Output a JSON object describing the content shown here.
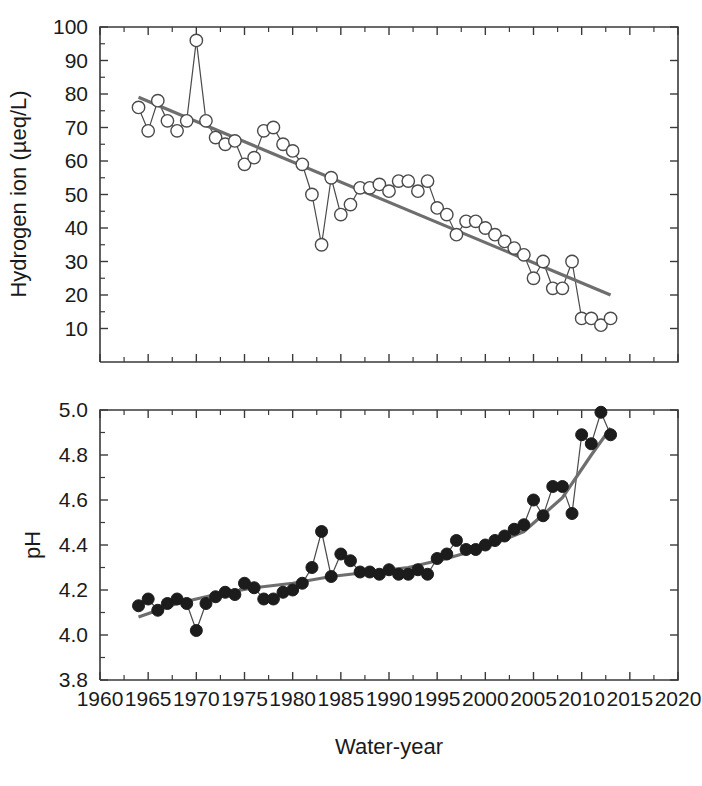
{
  "figure": {
    "width": 702,
    "height": 786,
    "background": "#ffffff",
    "xlabel": "Water-year"
  },
  "chart_data": [
    {
      "type": "line",
      "panel": "top",
      "title": "",
      "xlabel": "",
      "ylabel": "Hydrogen ion (µeq/L)",
      "xlim": [
        1960,
        2020
      ],
      "ylim": [
        0,
        100
      ],
      "xticks": [
        1960,
        1965,
        1970,
        1975,
        1980,
        1985,
        1990,
        1995,
        2000,
        2005,
        2010,
        2015,
        2020
      ],
      "xticklabels": [
        "",
        "",
        "",
        "",
        "",
        "",
        "",
        "",
        "",
        "",
        "",
        "",
        ""
      ],
      "yticks": [
        10,
        20,
        30,
        40,
        50,
        60,
        70,
        80,
        90,
        100
      ],
      "yticklabels": [
        "10",
        "20",
        "30",
        "40",
        "50",
        "60",
        "70",
        "80",
        "90",
        "100"
      ],
      "grid": false,
      "legend": "none",
      "marker": "open-circle",
      "series": [
        {
          "name": "Hydrogen ion",
          "x": [
            1964,
            1965,
            1966,
            1967,
            1968,
            1969,
            1970,
            1971,
            1972,
            1973,
            1974,
            1975,
            1976,
            1977,
            1978,
            1979,
            1980,
            1981,
            1982,
            1983,
            1984,
            1985,
            1986,
            1987,
            1988,
            1989,
            1990,
            1991,
            1992,
            1993,
            1994,
            1995,
            1996,
            1997,
            1998,
            1999,
            2000,
            2001,
            2002,
            2003,
            2004,
            2005,
            2006,
            2007,
            2008,
            2009,
            2010,
            2011,
            2012,
            2013
          ],
          "values": [
            76,
            69,
            78,
            72,
            69,
            72,
            96,
            72,
            67,
            65,
            66,
            59,
            61,
            69,
            70,
            65,
            63,
            59,
            50,
            35,
            55,
            44,
            47,
            52,
            52,
            53,
            51,
            54,
            54,
            51,
            54,
            46,
            44,
            38,
            42,
            42,
            40,
            38,
            36,
            34,
            32,
            25,
            30,
            22,
            22,
            30,
            13,
            13,
            11,
            13
          ]
        }
      ],
      "trend": {
        "name": "linear trend",
        "x": [
          1964,
          2013
        ],
        "values": [
          79,
          20
        ]
      }
    },
    {
      "type": "line",
      "panel": "bottom",
      "title": "",
      "xlabel": "Water-year",
      "ylabel": "pH",
      "xlim": [
        1960,
        2020
      ],
      "ylim": [
        3.8,
        5.0
      ],
      "xticks": [
        1960,
        1965,
        1970,
        1975,
        1980,
        1985,
        1990,
        1995,
        2000,
        2005,
        2010,
        2015,
        2020
      ],
      "xticklabels": [
        "1960",
        "1965",
        "1970",
        "1975",
        "1980",
        "1985",
        "1990",
        "1995",
        "2000",
        "2005",
        "2010",
        "2015",
        "2020"
      ],
      "yticks": [
        3.8,
        4.0,
        4.2,
        4.4,
        4.6,
        4.8,
        5.0
      ],
      "yticklabels": [
        "3.8",
        "4.0",
        "4.2",
        "4.4",
        "4.6",
        "4.8",
        "5.0"
      ],
      "grid": false,
      "legend": "none",
      "marker": "filled-circle",
      "series": [
        {
          "name": "pH",
          "x": [
            1964,
            1965,
            1966,
            1967,
            1968,
            1969,
            1970,
            1971,
            1972,
            1973,
            1974,
            1975,
            1976,
            1977,
            1978,
            1979,
            1980,
            1981,
            1982,
            1983,
            1984,
            1985,
            1986,
            1987,
            1988,
            1989,
            1990,
            1991,
            1992,
            1993,
            1994,
            1995,
            1996,
            1997,
            1998,
            1999,
            2000,
            2001,
            2002,
            2003,
            2004,
            2005,
            2006,
            2007,
            2008,
            2009,
            2010,
            2011,
            2012,
            2013
          ],
          "values": [
            4.13,
            4.16,
            4.11,
            4.14,
            4.16,
            4.14,
            4.02,
            4.14,
            4.17,
            4.19,
            4.18,
            4.23,
            4.21,
            4.16,
            4.16,
            4.19,
            4.2,
            4.23,
            4.3,
            4.46,
            4.26,
            4.36,
            4.33,
            4.28,
            4.28,
            4.27,
            4.29,
            4.27,
            4.27,
            4.29,
            4.27,
            4.34,
            4.36,
            4.42,
            4.38,
            4.38,
            4.4,
            4.42,
            4.44,
            4.47,
            4.49,
            4.6,
            4.53,
            4.66,
            4.66,
            4.54,
            4.89,
            4.85,
            4.99,
            4.89
          ]
        }
      ],
      "trend": {
        "name": "smoothed trend",
        "x": [
          1964,
          1968,
          1972,
          1976,
          1980,
          1984,
          1988,
          1992,
          1996,
          2000,
          2004,
          2008,
          2011,
          2013
        ],
        "values": [
          4.08,
          4.14,
          4.18,
          4.21,
          4.23,
          4.26,
          4.28,
          4.3,
          4.34,
          4.39,
          4.46,
          4.61,
          4.8,
          4.92
        ]
      }
    }
  ],
  "colors": {
    "axis": "#3a3a3a",
    "marker_open_fill": "#ffffff",
    "marker_stroke": "#4a4a4a",
    "marker_closed_fill": "#1c1c1c",
    "trend": "#6e6e6e",
    "text": "#1a1a1a"
  }
}
